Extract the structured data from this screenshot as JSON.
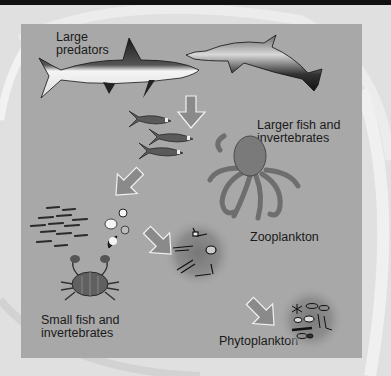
{
  "diagram": {
    "type": "food-chain",
    "color_scheme": "grayscale",
    "colors": {
      "background": "#e0e0e0",
      "panel": "#a8a8a8",
      "arrow_fill": "#8a8a8a",
      "arrow_stroke": "#f2f2f2",
      "text": "#1a1a1a",
      "top_band": "#111111"
    },
    "levels": [
      {
        "id": "large-predators",
        "label": "Large\npredators",
        "organisms": [
          "shark",
          "dolphin"
        ]
      },
      {
        "id": "larger-fish",
        "label": "Larger fish and\ninvertebrates",
        "organisms": [
          "tuna-school",
          "octopus"
        ]
      },
      {
        "id": "small-fish",
        "label": "Small fish and\ninvertebrates",
        "organisms": [
          "small-fish-school",
          "shells",
          "crab"
        ]
      },
      {
        "id": "zooplankton",
        "label": "Zooplankton",
        "organisms": [
          "zooplankton-cluster"
        ]
      },
      {
        "id": "phytoplankton",
        "label": "Phytoplankton",
        "organisms": [
          "phytoplankton-cluster"
        ]
      }
    ],
    "arrows": [
      {
        "from": "large-predators",
        "to": "larger-fish",
        "direction": "down"
      },
      {
        "from": "larger-fish",
        "to": "small-fish",
        "direction": "down-left"
      },
      {
        "from": "small-fish",
        "to": "zooplankton",
        "direction": "down-right"
      },
      {
        "from": "zooplankton",
        "to": "phytoplankton",
        "direction": "down-right"
      }
    ]
  }
}
